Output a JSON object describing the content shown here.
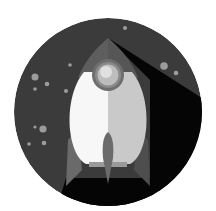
{
  "illustration": {
    "subject": "rocket-in-space-icon",
    "colors": {
      "background": "#ffffff",
      "space": "#3b3b3b",
      "shadow": "#050505",
      "nose": "#5e5e5e",
      "body_light": "#f7f7f7",
      "body_shade": "#c9c9c9",
      "fins": "#6a6a6a",
      "fin_shadow": "#4a4a4a",
      "window_ring": "#6e6e6e",
      "window_glass": "#bdbdbd",
      "window_highlight": "#e6e6e6",
      "flame": "#6b6b6b",
      "base": "#9a9a9a",
      "star": "#9c9c9c"
    },
    "stars": [
      {
        "cx": 125,
        "cy": 28,
        "r": 2
      },
      {
        "cx": 70,
        "cy": 65,
        "r": 1.8
      },
      {
        "cx": 35,
        "cy": 77,
        "r": 3.5
      },
      {
        "cx": 47,
        "cy": 84,
        "r": 2.3
      },
      {
        "cx": 35,
        "cy": 89,
        "r": 1.8
      },
      {
        "cx": 66,
        "cy": 91,
        "r": 2
      },
      {
        "cx": 164,
        "cy": 66,
        "r": 3.8
      },
      {
        "cx": 176,
        "cy": 73,
        "r": 2.3
      },
      {
        "cx": 35,
        "cy": 127,
        "r": 1.6
      },
      {
        "cx": 43,
        "cy": 129,
        "r": 3.6
      },
      {
        "cx": 29,
        "cy": 144,
        "r": 1.8
      },
      {
        "cx": 44,
        "cy": 143,
        "r": 2.3
      },
      {
        "cx": 162,
        "cy": 153,
        "r": 1.8
      },
      {
        "cx": 181,
        "cy": 148,
        "r": 4.8
      }
    ]
  }
}
